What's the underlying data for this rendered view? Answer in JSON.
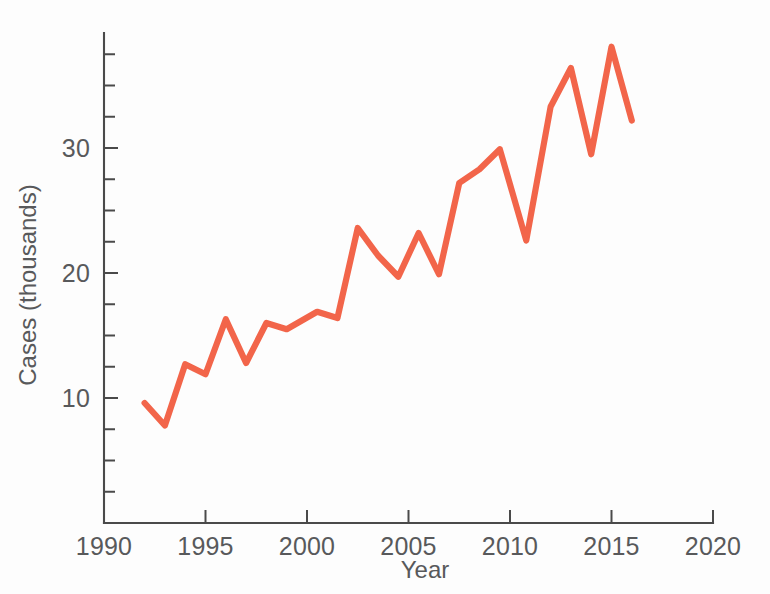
{
  "chart_data": {
    "type": "line",
    "title": "",
    "xlabel": "Year",
    "ylabel": "Cases (thousands)",
    "xlim": [
      1990,
      2020
    ],
    "ylim": [
      0,
      39.2
    ],
    "grid": false,
    "legend": "none",
    "line_color": "#F2654A",
    "axis_color": "#4a4a4a",
    "text_color": "#58595b",
    "x_ticks": [
      1990,
      1995,
      2000,
      2005,
      2010,
      2015,
      2020
    ],
    "x_tick_labels": [
      "1990",
      "1995",
      "2000",
      "2005",
      "2010",
      "2015",
      "2020"
    ],
    "x_minor_tick_step": 1,
    "y_ticks": [
      10,
      20,
      30
    ],
    "y_tick_labels": [
      "10",
      "20",
      "30"
    ],
    "y_minor_tick_step": 2.5,
    "series": [
      {
        "name": "Cases",
        "color": "#F2654A",
        "x": [
          1992,
          1993,
          1994,
          1995,
          1996,
          1997,
          1998,
          1999,
          2000,
          2001,
          2002,
          2003,
          2004,
          2005,
          2006,
          2007,
          2008,
          2009,
          2010,
          2011,
          2012,
          2013,
          2014,
          2015,
          2016
        ],
        "values": [
          9.6,
          7.8,
          12.7,
          11.9,
          16.3,
          12.8,
          16.0,
          15.5,
          16.8,
          16.4,
          23.6,
          21.4,
          19.7,
          23.1,
          19.9,
          27.2,
          28.3,
          29.9,
          22.6,
          33.4,
          36.4,
          29.5,
          38.1,
          32.2,
          32.2
        ]
      }
    ],
    "points": [
      {
        "x": 1992.0,
        "y": 9.6
      },
      {
        "x": 1993.0,
        "y": 7.8
      },
      {
        "x": 1994.0,
        "y": 12.7
      },
      {
        "x": 1995.0,
        "y": 11.9
      },
      {
        "x": 1996.0,
        "y": 16.3
      },
      {
        "x": 1997.0,
        "y": 12.8
      },
      {
        "x": 1998.0,
        "y": 16.0
      },
      {
        "x": 1999.0,
        "y": 15.5
      },
      {
        "x": 2000.5,
        "y": 16.9
      },
      {
        "x": 2001.5,
        "y": 16.4
      },
      {
        "x": 2002.5,
        "y": 23.6
      },
      {
        "x": 2003.5,
        "y": 21.4
      },
      {
        "x": 2004.5,
        "y": 19.7
      },
      {
        "x": 2005.5,
        "y": 23.2
      },
      {
        "x": 2006.5,
        "y": 19.9
      },
      {
        "x": 2007.5,
        "y": 27.2
      },
      {
        "x": 2008.5,
        "y": 28.3
      },
      {
        "x": 2009.5,
        "y": 29.9
      },
      {
        "x": 2010.8,
        "y": 22.6
      },
      {
        "x": 2012.0,
        "y": 33.3
      },
      {
        "x": 2013.0,
        "y": 36.4
      },
      {
        "x": 2014.0,
        "y": 29.5
      },
      {
        "x": 2015.0,
        "y": 38.1
      },
      {
        "x": 2016.0,
        "y": 32.2
      }
    ]
  }
}
